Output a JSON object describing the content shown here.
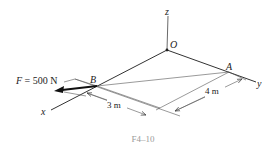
{
  "figure": {
    "caption": "F4–10",
    "axes": {
      "x": "x",
      "y": "y",
      "z": "z"
    },
    "points": {
      "origin": "O",
      "A": "A",
      "B": "B"
    },
    "force": {
      "symbol": "F",
      "equals": " = 500 N",
      "label": "F = 500 N",
      "magnitude": 500,
      "unit": "N"
    },
    "dimensions": {
      "d1": "3 m",
      "d2": "4 m"
    },
    "colors": {
      "line": "#333333",
      "thin": "#555555",
      "caption": "#9a9a9a",
      "background": "#ffffff"
    }
  }
}
